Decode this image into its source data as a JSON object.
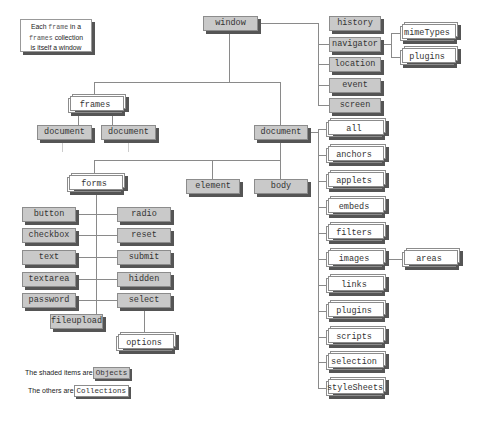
{
  "note": {
    "line1_prefix": "Each ",
    "line1_code": "frame",
    "line1_suffix": " in a",
    "line2_code": "frames",
    "line2_suffix": " collection",
    "line3": "is itself a window"
  },
  "nodes": {
    "window": "window",
    "history": "history",
    "navigator": "navigator",
    "location": "location",
    "event": "event",
    "screen": "screen",
    "mimeTypes": "mimeTypes",
    "nav_plugins": "plugins",
    "frames": "frames",
    "frame_document_1": "document",
    "frame_document_2": "document",
    "document": "document",
    "forms": "forms",
    "element": "element",
    "body": "body",
    "all": "all",
    "anchors": "anchors",
    "applets": "applets",
    "embeds": "embeds",
    "filters": "filters",
    "images": "images",
    "areas": "areas",
    "links": "links",
    "plugins": "plugins",
    "scripts": "scripts",
    "selection": "selection",
    "styleSheets": "styleSheets",
    "button": "button",
    "radio": "radio",
    "checkbox": "checkbox",
    "reset": "reset",
    "text": "text",
    "submit": "submit",
    "textarea": "textarea",
    "hidden": "hidden",
    "password": "password",
    "select": "select",
    "fileupload": "fileupload",
    "options": "options"
  },
  "legend": {
    "objects_text": "The shaded items are",
    "objects_chip": "Objects",
    "collections_text": "The others are",
    "collections_chip": "Collections"
  },
  "colors": {
    "object_fill": "#c9c9c9",
    "collection_fill": "#ffffff",
    "shadow": "#555555",
    "connector": "#8a8a8a"
  }
}
